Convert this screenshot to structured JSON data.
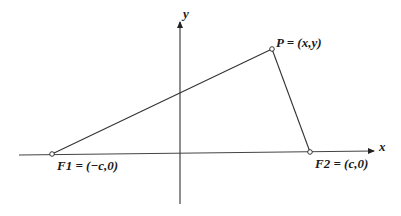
{
  "diagram": {
    "axes": {
      "x_label": "x",
      "y_label": "y"
    },
    "points": {
      "F1": {
        "label": "F1 = (−c,0)"
      },
      "F2": {
        "label": "F2 = (c,0)"
      },
      "P": {
        "label": "P = (x,y)"
      }
    },
    "colors": {
      "line": "#333333",
      "axis": "#444444",
      "point_fill": "#ffffff"
    }
  }
}
